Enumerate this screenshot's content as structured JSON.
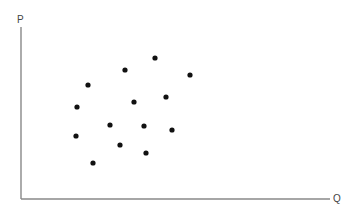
{
  "diagram": {
    "type": "scatter",
    "y_axis_label": "P",
    "x_axis_label": "Q",
    "axis_color": "#888888",
    "dot_color": "#111111",
    "dot_radius": 2.6,
    "origin": {
      "x": 21,
      "y": 199
    },
    "y_axis_top": 27,
    "x_axis_right": 330,
    "points": [
      {
        "x": 88,
        "y": 85
      },
      {
        "x": 125,
        "y": 70
      },
      {
        "x": 155,
        "y": 58
      },
      {
        "x": 190,
        "y": 75
      },
      {
        "x": 77,
        "y": 107
      },
      {
        "x": 134,
        "y": 102
      },
      {
        "x": 166,
        "y": 97
      },
      {
        "x": 110,
        "y": 125
      },
      {
        "x": 144,
        "y": 126
      },
      {
        "x": 172,
        "y": 130
      },
      {
        "x": 76,
        "y": 136
      },
      {
        "x": 120,
        "y": 145
      },
      {
        "x": 146,
        "y": 153
      },
      {
        "x": 93,
        "y": 163
      }
    ]
  }
}
